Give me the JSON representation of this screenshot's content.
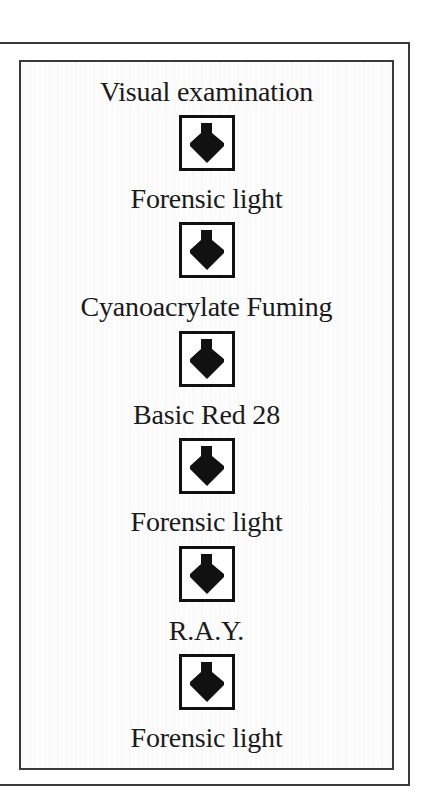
{
  "diagram": {
    "type": "vertical-flowchart",
    "steps": [
      {
        "label": "Visual examination"
      },
      {
        "label": "Forensic light"
      },
      {
        "label": "Cyanoacrylate Fuming"
      },
      {
        "label": "Basic Red 28"
      },
      {
        "label": "Forensic light"
      },
      {
        "label": "R.A.Y."
      },
      {
        "label": "Forensic light"
      }
    ],
    "connectors": [
      {
        "icon": "down-arrow-icon"
      },
      {
        "icon": "down-arrow-icon"
      },
      {
        "icon": "down-arrow-icon"
      },
      {
        "icon": "down-arrow-icon"
      },
      {
        "icon": "down-arrow-icon"
      },
      {
        "icon": "down-arrow-icon"
      }
    ],
    "colors": {
      "text": "#1a1a1a",
      "border": "#3a3a3a",
      "arrow": "#111111",
      "background": "#ffffff"
    }
  }
}
